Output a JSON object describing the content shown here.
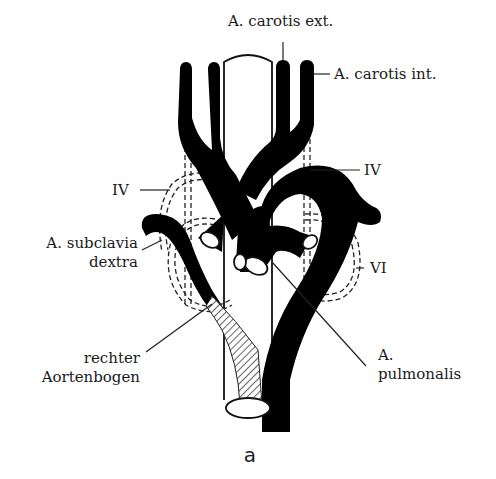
{
  "figure": {
    "caption": "a",
    "labels": {
      "carotis_ext": "A. carotis ext.",
      "carotis_int": "A. carotis int.",
      "arch_iv_right": "IV",
      "arch_iv_left": "IV",
      "subclavia_line1": "A. subclavia",
      "subclavia_line2": "dextra",
      "arch_vi": "VI",
      "aortenbogen_line1": "rechter",
      "aortenbogen_line2": "Aortenbogen",
      "pulmonalis_line1": "A.",
      "pulmonalis_line2": "pulmonalis"
    },
    "colors": {
      "vessel": "#000000",
      "background": "#ffffff",
      "text": "#1a1a1a"
    }
  }
}
